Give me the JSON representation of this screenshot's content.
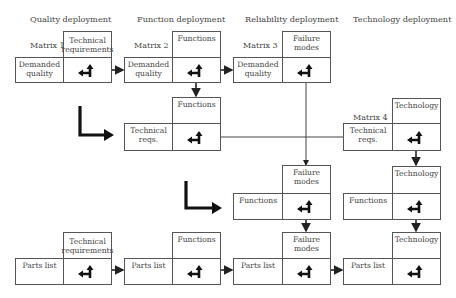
{
  "headers": [
    {
      "label": "Quality deployment"
    },
    {
      "label": "Function deployment"
    },
    {
      "label": "Reliability deployment"
    },
    {
      "label": "Technology deployment"
    }
  ],
  "matrices": {
    "m1": {
      "name": "Matrix 1",
      "top": "Technical requirements",
      "left": "Demanded quality"
    },
    "m2": {
      "name": "Matrix 2",
      "top": "Functions",
      "left": "Demanded quality"
    },
    "m3": {
      "name": "Matrix 3",
      "top": "Failure modes",
      "left": "Demanded quality"
    },
    "m4": {
      "name": "Matrix 4",
      "top": "Technology",
      "left": "Technical reqs."
    }
  },
  "row2": {
    "top": "Functions",
    "left": "Technical reqs."
  },
  "row3": {
    "reliability": {
      "top": "Failure modes",
      "left": "Functions"
    },
    "technology": {
      "top": "Technology",
      "left": "Functions"
    }
  },
  "row4": [
    {
      "top": "Technical requirements",
      "left": "Parts list"
    },
    {
      "top": "Functions",
      "left": "Parts list"
    },
    {
      "top": "Failure modes",
      "left": "Parts list"
    },
    {
      "top": "Technology",
      "left": "Parts list"
    }
  ],
  "icons": {
    "matrix_cell": "corner-arrow-icon",
    "flow": "elbow-arrow-icon"
  }
}
